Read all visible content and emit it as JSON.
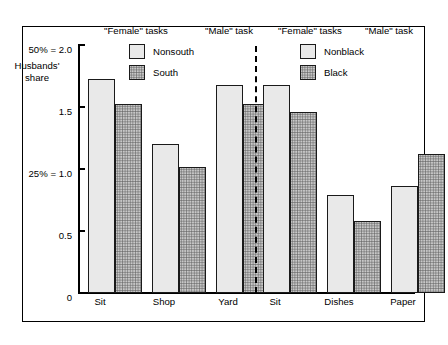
{
  "chart_data": {
    "type": "bar",
    "title": "",
    "xlabel": "",
    "ylabel": "Husbands' share",
    "ylim": [
      0,
      2.0
    ],
    "grid": false,
    "legend_position": "top-inside",
    "y_ticks": [
      {
        "value": 2.0,
        "label": "50% = 2.0"
      },
      {
        "value": 1.5,
        "label": "1.5"
      },
      {
        "value": 1.0,
        "label": "25% = 1.0"
      },
      {
        "value": 0.5,
        "label": "0.5"
      },
      {
        "value": 0.0,
        "label": "0"
      }
    ],
    "panels": [
      {
        "id": "region",
        "headers": [
          {
            "label": "\"Female\" tasks",
            "spans": [
              "Sit",
              "Shop"
            ]
          },
          {
            "label": "\"Male\" task",
            "spans": [
              "Yard"
            ]
          }
        ],
        "legend": [
          {
            "name": "Nonsouth",
            "style": "light"
          },
          {
            "name": "South",
            "style": "dark"
          }
        ],
        "categories": [
          "Sit",
          "Shop",
          "Yard"
        ],
        "series": [
          {
            "name": "Nonsouth",
            "values": [
              1.72,
              1.2,
              1.67
            ]
          },
          {
            "name": "South",
            "values": [
              1.52,
              1.01,
              1.52
            ]
          }
        ]
      },
      {
        "id": "race",
        "headers": [
          {
            "label": "\"Female\" tasks",
            "spans": [
              "Sit",
              "Dishes"
            ]
          },
          {
            "label": "\"Male\" task",
            "spans": [
              "Paper"
            ]
          }
        ],
        "legend": [
          {
            "name": "Nonblack",
            "style": "light"
          },
          {
            "name": "Black",
            "style": "dark"
          }
        ],
        "categories": [
          "Sit",
          "Dishes",
          "Paper"
        ],
        "series": [
          {
            "name": "Nonblack",
            "values": [
              1.67,
              0.79,
              0.86
            ]
          },
          {
            "name": "Black",
            "values": [
              1.45,
              0.58,
              1.12
            ]
          }
        ]
      }
    ]
  },
  "axis": {
    "caption_line1": "Husbands'",
    "caption_line2": "share"
  },
  "headers": {
    "h1": "\"Female\" tasks",
    "h2": "\"Male\" task",
    "h3": "\"Female\" tasks",
    "h4": "\"Male\" task"
  },
  "y_labels": {
    "t2_0": "50% = 2.0",
    "t1_5": "1.5",
    "t1_0": "25% = 1.0",
    "t0_5": "0.5",
    "t0": "0"
  },
  "x_labels": {
    "l0": "Sit",
    "l1": "Shop",
    "l2": "Yard",
    "l3": "Sit",
    "l4": "Dishes",
    "l5": "Paper"
  },
  "legend_left": {
    "item0": "Nonsouth",
    "item1": "South"
  },
  "legend_right": {
    "item0": "Nonblack",
    "item1": "Black"
  },
  "colors": {
    "light_fill": "#e9e9e9",
    "dark_fill": "#c8c8c8",
    "outline": "#1a1a1a",
    "background": "#ffffff"
  }
}
